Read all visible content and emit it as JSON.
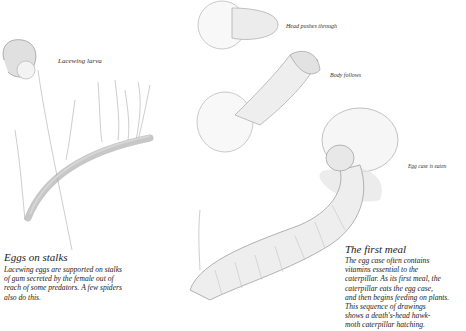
{
  "labels": {
    "lacewing_larva": "Lacewing larva",
    "head_pushes": "Head pushes through",
    "body_follows": "Body follows",
    "egg_case_eaten": "Egg case is eaten"
  },
  "captions": {
    "eggs_on_stalks": {
      "title": "Eggs on stalks",
      "lines": [
        "Lacewing eggs are supported on stalks",
        "of gum secreted by the female out of",
        "reach of some predators. A few spiders",
        "also do this."
      ]
    },
    "first_meal": {
      "title": "The first meal",
      "lines": [
        "The egg case often contains",
        "vitamins essential to the",
        "caterpillar. As its first meal, the",
        "caterpillar eats the egg case,",
        "and then begins feeding on plants.",
        "This sequence of drawings",
        "shows a death's-head hawk-",
        "moth caterpillar hatching."
      ]
    }
  },
  "illustrations": [
    "lacewing-larva-on-egg-stalks",
    "caterpillar-head-pushing-through-egg",
    "caterpillar-body-following",
    "caterpillar-eating-egg-case"
  ]
}
